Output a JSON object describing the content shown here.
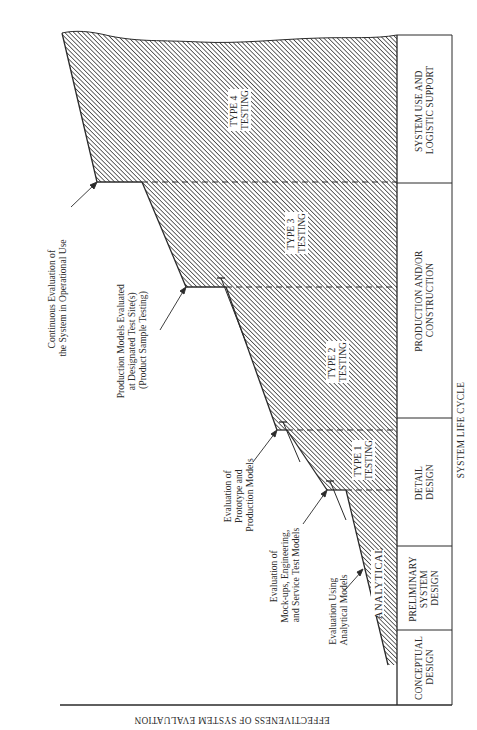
{
  "diagram": {
    "orientation_note": "rotated 90 degrees clockwise",
    "y_axis_label": "EFFECTIVENESS OF SYSTEM EVALUATION",
    "x_axis_label": "SYSTEM LIFE CYCLE",
    "phases": [
      {
        "lines": [
          "CONCEPTUAL",
          "DESIGN"
        ]
      },
      {
        "lines": [
          "PRELIMINARY",
          "SYSTEM",
          "DESIGN"
        ]
      },
      {
        "lines": [
          "DETAIL",
          "DESIGN"
        ]
      },
      {
        "lines": [
          "PRODUCTION AND/OR",
          "CONSTRUCTION"
        ]
      },
      {
        "lines": [
          "SYSTEM USE AND",
          "LOGISTIC SUPPORT"
        ]
      }
    ],
    "testing_regions": [
      {
        "lines": [
          "ANALYTICAL"
        ]
      },
      {
        "lines": [
          "TYPE 1",
          "TESTING"
        ]
      },
      {
        "lines": [
          "TYPE 2",
          "TESTING"
        ]
      },
      {
        "lines": [
          "TYPE 3",
          "TESTING"
        ]
      },
      {
        "lines": [
          "TYPE 4",
          "TESTING"
        ]
      }
    ],
    "annotations": [
      {
        "lines": [
          "Evaluation Using",
          "Analytical Models"
        ]
      },
      {
        "lines": [
          "Evaluation of",
          "Mock-ups, Engineering,",
          "and Service Test Models"
        ]
      },
      {
        "lines": [
          "Evaluation of",
          "Prototype and",
          "Production Models"
        ]
      },
      {
        "lines": [
          "Production Models Evaluated",
          "at Designated Test Site(s)",
          "(Product Sample Testing)"
        ]
      },
      {
        "lines": [
          "Continuous Evaluation of",
          "the System in Operational Use"
        ]
      }
    ],
    "colors": {
      "ink": "#2a2a2a",
      "hatch": "#3a3a3a",
      "background": "#ffffff"
    }
  }
}
